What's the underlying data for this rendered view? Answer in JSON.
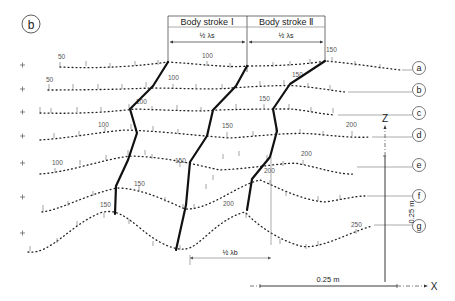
{
  "figure": {
    "panel_label": "b",
    "header": {
      "stroke_1": "Body stroke Ⅰ",
      "stroke_2": "Body stroke Ⅱ",
      "half_lambda_s_1": "½ λs",
      "half_lambda_s_2": "½ λs"
    },
    "half_lambda_b": "½ λb",
    "rows": [
      {
        "id": "a",
        "labels": [
          {
            "t": "50",
            "x": 84,
            "y": 60
          },
          {
            "t": "100",
            "x": 207,
            "y": 58
          },
          {
            "t": "150",
            "x": 331,
            "y": 52
          }
        ]
      },
      {
        "id": "b",
        "labels": [
          {
            "t": "50",
            "x": 50,
            "y": 84
          },
          {
            "t": "100",
            "x": 172,
            "y": 82
          },
          {
            "t": "150",
            "x": 295,
            "y": 78
          }
        ]
      },
      {
        "id": "c",
        "labels": [
          {
            "t": "100",
            "x": 140,
            "y": 106
          },
          {
            "t": "150",
            "x": 263,
            "y": 102
          }
        ]
      },
      {
        "id": "d",
        "labels": [
          {
            "t": "100",
            "x": 102,
            "y": 129
          },
          {
            "t": "150",
            "x": 226,
            "y": 131
          },
          {
            "t": "200",
            "x": 352,
            "y": 126
          }
        ]
      },
      {
        "id": "e",
        "labels": [
          {
            "t": "100",
            "x": 57,
            "y": 163
          },
          {
            "t": "150",
            "x": 179,
            "y": 161
          },
          {
            "t": "200",
            "x": 306,
            "y": 154
          }
        ]
      },
      {
        "id": "f",
        "labels": [
          {
            "t": "150",
            "x": 139,
            "y": 184
          },
          {
            "t": "200",
            "x": 268,
            "y": 172
          }
        ]
      },
      {
        "id": "g",
        "labels": [
          {
            "t": "150",
            "x": 105,
            "y": 206
          },
          {
            "t": "200",
            "x": 229,
            "y": 205
          },
          {
            "t": "250",
            "x": 356,
            "y": 226
          }
        ]
      }
    ],
    "axes": {
      "z_label": "Z",
      "x_label": "X",
      "z_scale": "0.25 m",
      "x_scale": "0.25 m"
    }
  }
}
